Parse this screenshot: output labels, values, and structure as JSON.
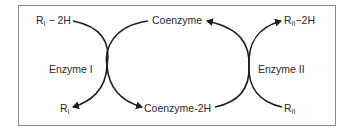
{
  "diagram": {
    "type": "coupled enzyme redox cycle",
    "left_cycle": {
      "enzyme_label": "Enzyme I",
      "substrate_reduced": {
        "base": "R",
        "sub": "I",
        "suffix": " − 2H"
      },
      "substrate_oxidized": {
        "base": "R",
        "sub": "I",
        "suffix": ""
      }
    },
    "right_cycle": {
      "enzyme_label": "Enzyme II",
      "substrate_reduced": {
        "base": "R",
        "sub": "II",
        "suffix": "−2H"
      },
      "substrate_oxidized": {
        "base": "R",
        "sub": "II",
        "suffix": ""
      }
    },
    "coenzyme_oxidized": "Coenzyme",
    "coenzyme_reduced": "Coenzyme-2H",
    "colors": {
      "line": "#1e1e1e",
      "frame": "#8a8a8a",
      "text": "#2a2a2a"
    }
  }
}
